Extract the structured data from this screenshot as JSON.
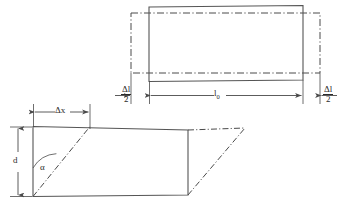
{
  "figure": {
    "background_color": "#ffffff",
    "line_color": "#4a4a4a",
    "text_color": "#2b2b2b"
  },
  "top_diagram": {
    "name": "tensile-elongation-diagram",
    "description": "Solid rectangle (original body) overlaid by dash-dot rectangle (elongated body)",
    "solid_rect": {
      "x": 149,
      "y": 6,
      "width": 154,
      "height": 75
    },
    "dashdot_rect": {
      "x": 131,
      "y": 13,
      "width": 189,
      "height": 60
    },
    "dimensions": [
      {
        "label_num": "Δl",
        "label_den": "2",
        "name": "delta-l-over-2-left",
        "value": "Δl/2"
      },
      {
        "label": "l",
        "subscript": "0",
        "name": "l-zero",
        "value": "l₀"
      },
      {
        "label_num": "Δl",
        "label_den": "2",
        "name": "delta-l-over-2-right",
        "value": "Δl/2"
      }
    ],
    "dimension_line_y": 95
  },
  "bottom_diagram": {
    "name": "shear-strain-diagram",
    "description": "Solid rectangle with dash-dot sheared parallelogram showing shear displacement",
    "solid_rect": {
      "x": 33,
      "y": 126,
      "width": 155,
      "height": 70
    },
    "shear_offset_x": 57,
    "labels": {
      "delta_x": "Δx",
      "depth": "d",
      "angle": "α"
    },
    "dimensions": [
      {
        "label": "Δx",
        "name": "delta-x",
        "orientation": "horizontal",
        "y": 112
      },
      {
        "label": "d",
        "name": "depth-d",
        "orientation": "vertical",
        "x": 18
      },
      {
        "label": "α",
        "name": "shear-angle-alpha",
        "orientation": "angle"
      }
    ]
  },
  "legend": {
    "solid_line": "original / undeformed outline",
    "dashdot_line": "deformed outline"
  }
}
